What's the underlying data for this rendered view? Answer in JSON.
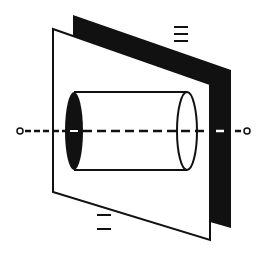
{
  "diagram": {
    "colors": {
      "background": "#ffffff",
      "ink": "#111111",
      "back_plane_fill": "#111111",
      "front_plane_fill": "#ffffff"
    },
    "labels": {
      "back_plane_label": "三",
      "front_plane_label": "二"
    },
    "label_bars": {
      "back_plane": 3,
      "front_plane": 2
    },
    "back_plane": {
      "points": [
        [
          73,
          15
        ],
        [
          231,
          70
        ],
        [
          231,
          228
        ],
        [
          210,
          222
        ],
        [
          210,
          84
        ],
        [
          73,
          36
        ]
      ]
    },
    "front_plane": {
      "points": [
        [
          53,
          29
        ],
        [
          210,
          84
        ],
        [
          210,
          240
        ],
        [
          53,
          192
        ]
      ]
    },
    "cylinder": {
      "left_cap": {
        "cx": 74,
        "cy": 131,
        "rx": 9,
        "ry": 39,
        "filled": true
      },
      "right_cap": {
        "cx": 187,
        "cy": 131,
        "rx": 10,
        "ry": 39,
        "filled": false
      }
    },
    "axis": {
      "y": 131,
      "x_start": 20,
      "x_end": 247,
      "endpoint_style": "open-circle"
    }
  }
}
